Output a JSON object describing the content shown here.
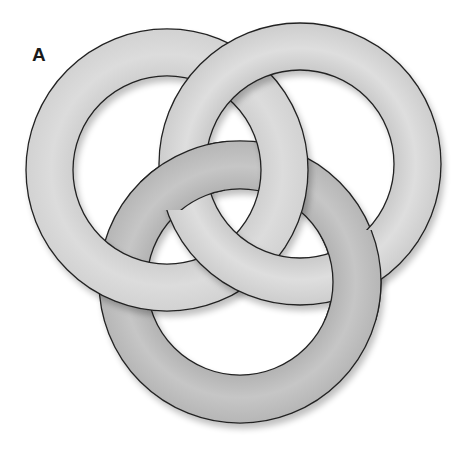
{
  "figure": {
    "panel_label": "A",
    "rings": [
      {
        "id": "left",
        "cx": 167,
        "cy": 170,
        "outer_r": 141,
        "inner_r": 94,
        "fill": "#d8d8d8"
      },
      {
        "id": "right",
        "cx": 300,
        "cy": 164,
        "outer_r": 141,
        "inner_r": 94,
        "fill": "#d3d3d3"
      },
      {
        "id": "bottom",
        "cx": 240,
        "cy": 282,
        "outer_r": 141,
        "inner_r": 93,
        "fill": "#bcbcbc"
      }
    ],
    "stroke_color": "#222222",
    "crossings": [
      {
        "rings": [
          "right",
          "left"
        ],
        "position": "top",
        "over": "right"
      },
      {
        "rings": [
          "right",
          "left"
        ],
        "position": "lower-middle",
        "over": "right"
      },
      {
        "rings": [
          "left",
          "bottom"
        ],
        "position": "upper-right",
        "over": "left"
      },
      {
        "rings": [
          "left",
          "bottom"
        ],
        "position": "lower-left",
        "over": "left"
      },
      {
        "rings": [
          "bottom",
          "right"
        ],
        "position": "upper-left",
        "over": "bottom"
      },
      {
        "rings": [
          "right",
          "bottom"
        ],
        "position": "upper-right",
        "over": "right"
      },
      {
        "rings": [
          "bottom",
          "right"
        ],
        "position": "lower-right",
        "over": "bottom"
      }
    ]
  }
}
